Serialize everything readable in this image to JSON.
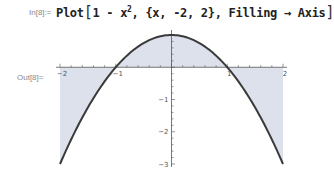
{
  "cell": {
    "in_label": "In[8]:=",
    "out_label": "Out[8]=",
    "input": {
      "func_name": "Plot",
      "open_bracket": "[",
      "expr_prefix": "1 - x",
      "exponent": "2",
      "rest": ", {x, -2, 2}, Filling",
      "arrow": "→",
      "option_value": "Axis",
      "close_bracket": "]"
    }
  },
  "chart_data": {
    "type": "area",
    "function": "1 - x^2",
    "variable": "x",
    "xlim": [
      -2,
      2
    ],
    "ylim": [
      -3,
      1
    ],
    "filling": "Axis",
    "x_ticks": [
      {
        "value": -2,
        "label": "-2"
      },
      {
        "value": -1,
        "label": "-1"
      },
      {
        "value": 1,
        "label": "1"
      },
      {
        "value": 2,
        "label": "2"
      }
    ],
    "y_ticks": [
      {
        "value": -1,
        "label": "-1"
      },
      {
        "value": -2,
        "label": "-2"
      },
      {
        "value": -3,
        "label": "-3"
      }
    ],
    "minor_tick_step": 0.2,
    "colors": {
      "curve": "#3a3a3a",
      "fill": "#dde1ec",
      "axis": "#555555"
    },
    "title": "",
    "xlabel": "",
    "ylabel": "",
    "grid": false
  }
}
